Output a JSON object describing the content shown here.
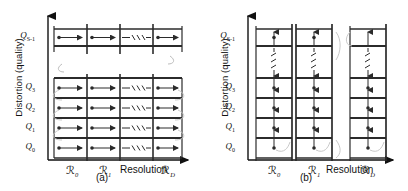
{
  "figure": {
    "axis_label_y": "Distortion (quality)",
    "axis_label_x": "Resolution"
  },
  "panels": [
    {
      "id": "a",
      "caption": "(a)",
      "scan_order": "resolution-major",
      "arrow_direction": "horizontal-right",
      "y_label": "Distortion (quality)",
      "x_label": "Resolution",
      "quality_ticks": [
        {
          "base": "Q",
          "sub": "0"
        },
        {
          "base": "Q",
          "sub": "1"
        },
        {
          "base": "Q",
          "sub": "2"
        },
        {
          "base": "Q",
          "sub": "3"
        },
        {
          "base": "Q",
          "sub": "S-1"
        }
      ],
      "resolution_ticks": [
        {
          "base": "R",
          "sub": "0"
        },
        {
          "base": "R",
          "sub": "1"
        },
        {
          "base": "R",
          "sub": "D"
        }
      ],
      "ellipsis_x": "horizontal-dots",
      "ellipsis_y": "vertical-gap"
    },
    {
      "id": "b",
      "caption": "(b)",
      "scan_order": "quality-major",
      "arrow_direction": "vertical-up",
      "y_label": "Distortion (quality)",
      "x_label": "Resolution",
      "quality_ticks": [
        {
          "base": "Q",
          "sub": "0"
        },
        {
          "base": "Q",
          "sub": "1"
        },
        {
          "base": "Q",
          "sub": "2"
        },
        {
          "base": "Q",
          "sub": "3"
        },
        {
          "base": "Q",
          "sub": "S-1"
        }
      ],
      "resolution_ticks": [
        {
          "base": "R",
          "sub": "0"
        },
        {
          "base": "R",
          "sub": "1"
        },
        {
          "base": "R",
          "sub": "D"
        }
      ],
      "ellipsis_x": "horizontal-gap",
      "ellipsis_y": "vertical-dots"
    }
  ],
  "colors": {
    "line": "#2b2b2b",
    "text": "#111111",
    "background": "#ffffff"
  }
}
